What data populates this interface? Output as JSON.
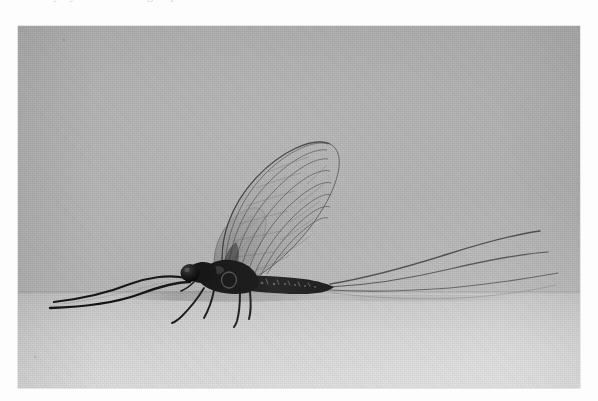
{
  "page": {
    "background_color": "#fdfdfd",
    "cropped_text_fragment": "a mayfly  dun   subimago  spinner"
  },
  "photo": {
    "title": "Mayfly in side profile",
    "medium": "black and white photograph",
    "frame": {
      "x": 18,
      "y": 26,
      "width": 562,
      "height": 362
    },
    "backdrop_color": "#b5b5b5",
    "surface_color": "#d8d8d8",
    "horizon_y_fraction": 0.732,
    "subject_color": "#1b1b1b",
    "wing_membrane_color": "#a3a3a3",
    "wing_vein_color": "#4e4e4e"
  },
  "subject": {
    "common_name": "mayfly",
    "order": "Ephemeroptera",
    "pose": "lateral / side view, standing",
    "facing": "left",
    "parts": [
      {
        "name": "compound-eye",
        "description": "large rounded dark eye at the head"
      },
      {
        "name": "head",
        "description": "small dark head behind the eye"
      },
      {
        "name": "thorax",
        "description": "robust dark thorax bearing the wings"
      },
      {
        "name": "abdomen",
        "description": "long tapering segmented abdomen with pale segment markings"
      },
      {
        "name": "forewing",
        "description": "large translucent triangular wing held upright with dense venation"
      },
      {
        "name": "hindwing",
        "description": "smaller translucent wing beneath the forewing"
      },
      {
        "name": "foreleg",
        "description": "elongated foreleg extended forward"
      },
      {
        "name": "midleg",
        "description": "slender leg reaching down to the surface"
      },
      {
        "name": "hindleg",
        "description": "slender leg reaching down to the surface"
      },
      {
        "name": "cercus",
        "description": "long filamentous tail"
      }
    ],
    "tail_count": 3,
    "wing_count": 2,
    "leg_count": 6
  }
}
